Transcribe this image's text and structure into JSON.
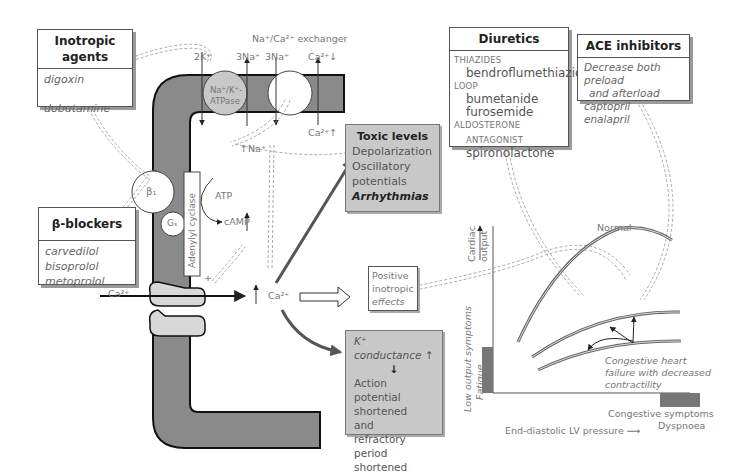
{
  "inotropic": {
    "title": "Inotropic agents",
    "drugs": [
      "digoxin",
      "dobutamine"
    ]
  },
  "beta_blockers": {
    "title": "β-blockers",
    "drugs": [
      "carvedilol",
      "bisoprolol",
      "metoprolol"
    ]
  },
  "diuretics": {
    "title": "Diuretics",
    "groups": [
      {
        "category": "THIAZIDES",
        "drugs": [
          "bendroflumethiazide"
        ]
      },
      {
        "category": "LOOP",
        "drugs": [
          "bumetanide",
          "furosemide"
        ]
      },
      {
        "category": "ALDOSTERONE",
        "category2": "ANTAGONIST",
        "drugs": [
          "spironolactone"
        ]
      }
    ]
  },
  "ace": {
    "title": "ACE inhibitors",
    "lines": [
      "Decrease both preload",
      "and afterload",
      "captopril",
      "enalapril"
    ]
  },
  "cell": {
    "exchanger_label": "Na⁺/Ca²⁺ exchanger",
    "pump_label_1": "Na⁺/K⁺-",
    "pump_label_2": "ATPase",
    "ion_2k": "2K⁺",
    "ion_3na_a": "3Na⁺",
    "ion_3na_b": "3Na⁺",
    "ion_ca_out": "Ca²⁺↓",
    "ion_ca_in": "Ca²⁺↑",
    "ion_na_in": "↑Na⁺",
    "beta1": "β₁",
    "gs": "Gₛ",
    "adenylyl": "Adenylyl cyclase",
    "atp": "ATP",
    "camp": "cAMP",
    "plus": "+",
    "ca_entry": "Ca²⁺",
    "ca_center": "Ca²⁺",
    "minus": "−"
  },
  "toxic": {
    "title": "Toxic levels",
    "lines": [
      "Depolarization",
      "Oscillatory",
      "potentials"
    ],
    "bold": "Arrhythmias"
  },
  "positive": {
    "lines": [
      "Positive",
      "inotropic",
      "effects"
    ]
  },
  "kconductance": {
    "title": "K⁺ conductance ↑",
    "arrow": "↓",
    "lines": [
      "Action potential",
      "shortened",
      "and",
      "refractory period",
      "shortened"
    ]
  },
  "graph": {
    "y_label_1": "Cardiac",
    "y_label_2": "output",
    "low_output_1": "Low output symptoms",
    "low_output_2": "Fatigue",
    "normal": "Normal",
    "chf_lines": [
      "Congestive heart",
      "failure with decreased",
      "contractility"
    ],
    "congestive_1": "Congestive symptoms",
    "congestive_2": "Dyspnoea",
    "x_label": "End-diastolic LV pressure ⟶"
  }
}
